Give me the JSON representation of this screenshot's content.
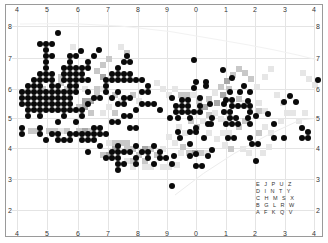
{
  "map": {
    "x_ticks": [
      {
        "label": "4",
        "x": 15
      },
      {
        "label": "5",
        "x": 45
      },
      {
        "label": "6",
        "x": 76
      },
      {
        "label": "7",
        "x": 106
      },
      {
        "label": "8",
        "x": 136
      },
      {
        "label": "9",
        "x": 165
      },
      {
        "label": "0",
        "x": 194
      },
      {
        "label": "1",
        "x": 224
      },
      {
        "label": "2",
        "x": 253
      },
      {
        "label": "3",
        "x": 283
      },
      {
        "label": "4",
        "x": 312
      }
    ],
    "y_ticks": [
      {
        "label": "8",
        "y": 23
      },
      {
        "label": "7",
        "y": 55
      },
      {
        "label": "6",
        "y": 86
      },
      {
        "label": "5",
        "y": 115
      },
      {
        "label": "4",
        "y": 145
      },
      {
        "label": "3",
        "y": 176
      },
      {
        "label": "2",
        "y": 207
      }
    ],
    "grid_key": {
      "rows": [
        "E J P U Z",
        "D I N T Y",
        "C H M S X",
        "B G L R W",
        "A F K Q V"
      ]
    },
    "colors": {
      "dot": "#0a0a0a",
      "shade_light": "#e6e6e6",
      "shade_mid": "#c8c8c8",
      "shade_dark": "#a8a8a8",
      "gridline": "#e4e4e4"
    },
    "dots": [
      [
        58,
        33
      ],
      [
        40,
        44
      ],
      [
        46,
        44
      ],
      [
        52,
        44
      ],
      [
        46,
        50
      ],
      [
        81,
        51
      ],
      [
        99,
        50
      ],
      [
        46,
        56
      ],
      [
        52,
        56
      ],
      [
        70,
        56
      ],
      [
        76,
        56
      ],
      [
        94,
        56
      ],
      [
        127,
        56
      ],
      [
        46,
        62
      ],
      [
        70,
        62
      ],
      [
        88,
        62
      ],
      [
        124,
        62
      ],
      [
        130,
        62
      ],
      [
        46,
        68
      ],
      [
        64,
        68
      ],
      [
        70,
        68
      ],
      [
        76,
        68
      ],
      [
        82,
        68
      ],
      [
        88,
        68
      ],
      [
        118,
        68
      ],
      [
        40,
        74
      ],
      [
        46,
        74
      ],
      [
        52,
        74
      ],
      [
        64,
        74
      ],
      [
        70,
        74
      ],
      [
        76,
        74
      ],
      [
        82,
        74
      ],
      [
        112,
        74
      ],
      [
        118,
        74
      ],
      [
        124,
        74
      ],
      [
        130,
        74
      ],
      [
        34,
        80
      ],
      [
        40,
        80
      ],
      [
        46,
        80
      ],
      [
        52,
        80
      ],
      [
        64,
        80
      ],
      [
        70,
        80
      ],
      [
        76,
        80
      ],
      [
        82,
        80
      ],
      [
        88,
        80
      ],
      [
        106,
        80
      ],
      [
        112,
        80
      ],
      [
        118,
        80
      ],
      [
        124,
        80
      ],
      [
        130,
        80
      ],
      [
        136,
        80
      ],
      [
        142,
        80
      ],
      [
        28,
        86
      ],
      [
        34,
        86
      ],
      [
        40,
        86
      ],
      [
        52,
        86
      ],
      [
        58,
        86
      ],
      [
        70,
        86
      ],
      [
        76,
        86
      ],
      [
        106,
        86
      ],
      [
        148,
        86
      ],
      [
        22,
        92
      ],
      [
        28,
        92
      ],
      [
        34,
        92
      ],
      [
        40,
        92
      ],
      [
        46,
        92
      ],
      [
        52,
        92
      ],
      [
        58,
        92
      ],
      [
        64,
        92
      ],
      [
        70,
        92
      ],
      [
        76,
        92
      ],
      [
        88,
        92
      ],
      [
        106,
        92
      ],
      [
        118,
        92
      ],
      [
        142,
        92
      ],
      [
        148,
        92
      ],
      [
        22,
        98
      ],
      [
        28,
        98
      ],
      [
        34,
        98
      ],
      [
        40,
        98
      ],
      [
        46,
        98
      ],
      [
        52,
        98
      ],
      [
        58,
        98
      ],
      [
        64,
        98
      ],
      [
        70,
        98
      ],
      [
        94,
        98
      ],
      [
        100,
        98
      ],
      [
        112,
        98
      ],
      [
        124,
        98
      ],
      [
        130,
        98
      ],
      [
        172,
        98
      ],
      [
        22,
        104
      ],
      [
        28,
        104
      ],
      [
        34,
        104
      ],
      [
        40,
        104
      ],
      [
        46,
        104
      ],
      [
        52,
        104
      ],
      [
        58,
        104
      ],
      [
        64,
        104
      ],
      [
        70,
        104
      ],
      [
        88,
        104
      ],
      [
        118,
        104
      ],
      [
        124,
        104
      ],
      [
        142,
        104
      ],
      [
        148,
        104
      ],
      [
        154,
        104
      ],
      [
        28,
        110
      ],
      [
        34,
        110
      ],
      [
        40,
        110
      ],
      [
        46,
        110
      ],
      [
        52,
        110
      ],
      [
        58,
        110
      ],
      [
        64,
        110
      ],
      [
        70,
        110
      ],
      [
        76,
        110
      ],
      [
        82,
        110
      ],
      [
        136,
        110
      ],
      [
        160,
        110
      ],
      [
        28,
        116
      ],
      [
        40,
        116
      ],
      [
        64,
        116
      ],
      [
        82,
        116
      ],
      [
        124,
        116
      ],
      [
        130,
        116
      ],
      [
        58,
        122
      ],
      [
        76,
        122
      ],
      [
        112,
        122
      ],
      [
        118,
        122
      ],
      [
        22,
        128
      ],
      [
        40,
        128
      ],
      [
        94,
        128
      ],
      [
        100,
        128
      ],
      [
        130,
        128
      ],
      [
        136,
        128
      ],
      [
        22,
        134
      ],
      [
        40,
        134
      ],
      [
        52,
        134
      ],
      [
        58,
        134
      ],
      [
        70,
        134
      ],
      [
        76,
        134
      ],
      [
        82,
        134
      ],
      [
        88,
        134
      ],
      [
        94,
        134
      ],
      [
        100,
        134
      ],
      [
        106,
        134
      ],
      [
        46,
        140
      ],
      [
        58,
        140
      ],
      [
        64,
        140
      ],
      [
        70,
        140
      ],
      [
        82,
        140
      ],
      [
        88,
        140
      ],
      [
        94,
        140
      ],
      [
        100,
        146
      ],
      [
        118,
        146
      ],
      [
        136,
        146
      ],
      [
        154,
        146
      ],
      [
        88,
        152
      ],
      [
        112,
        152
      ],
      [
        118,
        152
      ],
      [
        124,
        152
      ],
      [
        130,
        152
      ],
      [
        142,
        152
      ],
      [
        148,
        152
      ],
      [
        160,
        152
      ],
      [
        106,
        158
      ],
      [
        112,
        158
      ],
      [
        118,
        158
      ],
      [
        136,
        158
      ],
      [
        148,
        158
      ],
      [
        160,
        158
      ],
      [
        166,
        158
      ],
      [
        118,
        164
      ],
      [
        124,
        164
      ],
      [
        136,
        164
      ],
      [
        154,
        164
      ],
      [
        172,
        164
      ],
      [
        118,
        170
      ],
      [
        172,
        186
      ],
      [
        178,
        132
      ],
      [
        190,
        132
      ],
      [
        196,
        132
      ],
      [
        208,
        124
      ],
      [
        232,
        124
      ],
      [
        238,
        124
      ],
      [
        250,
        124
      ],
      [
        274,
        124
      ],
      [
        196,
        128
      ],
      [
        180,
        138
      ],
      [
        204,
        138
      ],
      [
        228,
        138
      ],
      [
        234,
        138
      ],
      [
        250,
        138
      ],
      [
        274,
        138
      ],
      [
        284,
        138
      ],
      [
        302,
        128
      ],
      [
        302,
        138
      ],
      [
        190,
        144
      ],
      [
        252,
        144
      ],
      [
        258,
        144
      ],
      [
        212,
        150
      ],
      [
        174,
        156
      ],
      [
        190,
        156
      ],
      [
        196,
        154
      ],
      [
        208,
        156
      ],
      [
        256,
        161
      ],
      [
        196,
        166
      ],
      [
        202,
        166
      ],
      [
        194,
        60
      ],
      [
        223,
        70
      ],
      [
        232,
        78
      ],
      [
        244,
        86
      ],
      [
        240,
        92
      ],
      [
        230,
        92
      ],
      [
        250,
        92
      ],
      [
        226,
        100
      ],
      [
        232,
        100
      ],
      [
        248,
        101
      ],
      [
        206,
        82
      ],
      [
        196,
        82
      ],
      [
        194,
        88
      ],
      [
        206,
        86
      ],
      [
        182,
        100
      ],
      [
        188,
        100
      ],
      [
        200,
        98
      ],
      [
        176,
        106
      ],
      [
        182,
        106
      ],
      [
        188,
        106
      ],
      [
        200,
        106
      ],
      [
        210,
        104
      ],
      [
        224,
        104
      ],
      [
        232,
        106
      ],
      [
        238,
        106
      ],
      [
        244,
        106
      ],
      [
        250,
        106
      ],
      [
        176,
        112
      ],
      [
        182,
        112
      ],
      [
        188,
        112
      ],
      [
        194,
        112
      ],
      [
        200,
        112
      ],
      [
        224,
        112
      ],
      [
        230,
        112
      ],
      [
        250,
        112
      ],
      [
        170,
        118
      ],
      [
        178,
        118
      ],
      [
        190,
        118
      ],
      [
        212,
        118
      ],
      [
        230,
        118
      ],
      [
        236,
        118
      ],
      [
        248,
        118
      ],
      [
        256,
        116
      ],
      [
        268,
        114
      ],
      [
        211,
        124
      ],
      [
        226,
        124
      ],
      [
        284,
        102
      ],
      [
        290,
        96
      ],
      [
        296,
        102
      ],
      [
        318,
        80
      ],
      [
        308,
        138
      ],
      [
        308,
        132
      ]
    ],
    "shade_cells": [
      [
        70,
        44,
        1
      ],
      [
        118,
        44,
        1
      ],
      [
        124,
        50,
        2
      ],
      [
        106,
        56,
        2
      ],
      [
        100,
        62,
        2
      ],
      [
        94,
        68,
        2
      ],
      [
        100,
        74,
        3
      ],
      [
        94,
        86,
        2
      ],
      [
        88,
        98,
        3
      ],
      [
        82,
        98,
        3
      ],
      [
        58,
        74,
        2
      ],
      [
        58,
        80,
        2
      ],
      [
        64,
        86,
        2
      ],
      [
        82,
        86,
        1
      ],
      [
        94,
        92,
        2
      ],
      [
        100,
        86,
        1
      ],
      [
        112,
        92,
        2
      ],
      [
        118,
        98,
        1
      ],
      [
        130,
        92,
        2
      ],
      [
        136,
        98,
        1
      ],
      [
        40,
        86,
        2
      ],
      [
        46,
        98,
        2
      ],
      [
        58,
        104,
        1
      ],
      [
        76,
        104,
        2
      ],
      [
        82,
        104,
        3
      ],
      [
        88,
        110,
        2
      ],
      [
        100,
        110,
        1
      ],
      [
        106,
        104,
        1
      ],
      [
        112,
        110,
        2
      ],
      [
        28,
        128,
        2
      ],
      [
        34,
        128,
        2
      ],
      [
        46,
        128,
        2
      ],
      [
        52,
        128,
        2
      ],
      [
        58,
        128,
        1
      ],
      [
        64,
        128,
        2
      ],
      [
        76,
        128,
        2
      ],
      [
        82,
        128,
        3
      ],
      [
        88,
        128,
        2
      ],
      [
        106,
        140,
        1
      ],
      [
        112,
        140,
        2
      ],
      [
        118,
        140,
        2
      ],
      [
        124,
        140,
        2
      ],
      [
        130,
        146,
        2
      ],
      [
        142,
        146,
        3
      ],
      [
        148,
        146,
        2
      ],
      [
        160,
        146,
        1
      ],
      [
        112,
        146,
        3
      ],
      [
        124,
        146,
        2
      ],
      [
        100,
        152,
        2
      ],
      [
        106,
        152,
        3
      ],
      [
        136,
        152,
        2
      ],
      [
        154,
        152,
        2
      ],
      [
        124,
        158,
        1
      ],
      [
        130,
        158,
        2
      ],
      [
        142,
        158,
        2
      ],
      [
        130,
        164,
        1
      ],
      [
        142,
        164,
        1
      ],
      [
        148,
        164,
        1
      ],
      [
        160,
        164,
        1
      ],
      [
        166,
        164,
        1
      ],
      [
        154,
        80,
        1
      ],
      [
        160,
        86,
        1
      ],
      [
        166,
        92,
        1
      ],
      [
        172,
        86,
        1
      ],
      [
        178,
        92,
        2
      ],
      [
        184,
        92,
        2
      ],
      [
        190,
        92,
        1
      ],
      [
        196,
        98,
        2
      ],
      [
        202,
        104,
        3
      ],
      [
        206,
        96,
        2
      ],
      [
        212,
        90,
        1
      ],
      [
        218,
        84,
        2
      ],
      [
        224,
        78,
        3
      ],
      [
        230,
        72,
        2
      ],
      [
        236,
        66,
        2
      ],
      [
        242,
        70,
        2
      ],
      [
        248,
        76,
        2
      ],
      [
        254,
        84,
        1
      ],
      [
        214,
        100,
        3
      ],
      [
        220,
        92,
        3
      ],
      [
        226,
        86,
        2
      ],
      [
        236,
        96,
        2
      ],
      [
        242,
        100,
        1
      ],
      [
        256,
        100,
        1
      ],
      [
        262,
        108,
        1
      ],
      [
        256,
        108,
        2
      ],
      [
        188,
        118,
        2
      ],
      [
        194,
        124,
        2
      ],
      [
        200,
        118,
        1
      ],
      [
        206,
        112,
        2
      ],
      [
        212,
        110,
        1
      ],
      [
        218,
        116,
        1
      ],
      [
        224,
        118,
        1
      ],
      [
        236,
        124,
        2
      ],
      [
        242,
        118,
        2
      ],
      [
        176,
        124,
        1
      ],
      [
        182,
        130,
        1
      ],
      [
        206,
        130,
        1
      ],
      [
        214,
        136,
        1
      ],
      [
        220,
        130,
        1
      ],
      [
        226,
        130,
        1
      ],
      [
        256,
        130,
        2
      ],
      [
        262,
        124,
        1
      ],
      [
        268,
        130,
        1
      ],
      [
        180,
        144,
        2
      ],
      [
        186,
        150,
        2
      ],
      [
        192,
        150,
        3
      ],
      [
        198,
        150,
        2
      ],
      [
        204,
        150,
        1
      ],
      [
        222,
        142,
        1
      ],
      [
        228,
        146,
        2
      ],
      [
        240,
        146,
        1
      ],
      [
        246,
        150,
        1
      ],
      [
        172,
        140,
        1
      ],
      [
        166,
        134,
        1
      ],
      [
        178,
        150,
        1
      ],
      [
        174,
        162,
        1
      ],
      [
        260,
        150,
        1
      ],
      [
        266,
        144,
        1
      ],
      [
        278,
        118,
        1
      ],
      [
        284,
        110,
        1
      ],
      [
        290,
        110,
        1
      ],
      [
        300,
        70,
        1
      ],
      [
        306,
        76,
        1
      ],
      [
        312,
        82,
        1
      ],
      [
        268,
        66,
        1
      ],
      [
        262,
        74,
        1
      ],
      [
        274,
        92,
        1
      ],
      [
        280,
        100,
        1
      ],
      [
        296,
        118,
        1
      ],
      [
        302,
        110,
        1
      ]
    ]
  }
}
